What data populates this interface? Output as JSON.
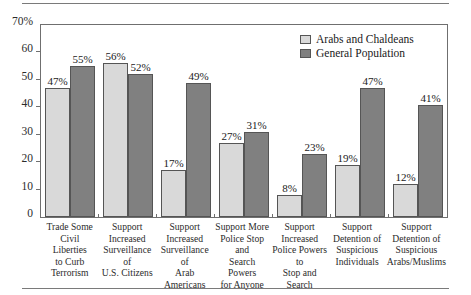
{
  "chart_data": {
    "type": "bar",
    "title": "",
    "subtitle": "",
    "xlabel": "",
    "ylabel": "",
    "ylim": [
      0,
      70
    ],
    "yticks": [
      0,
      10,
      20,
      30,
      40,
      50,
      60,
      70
    ],
    "ytick_labels": [
      "0",
      "10",
      "20",
      "30",
      "40",
      "50",
      "60",
      "70%"
    ],
    "grid": false,
    "legend_position": "top-right",
    "categories": [
      "Trade Some Civil Liberties to Curb Terrorism",
      "Support Increased Surveillance of U.S. Citizens",
      "Support Increased Surveillance of Arab Americans",
      "Support More Police Stop and Search Powers for Anyone",
      "Support Increased Police Powers to Stop and Search",
      "Support Detention of Suspicious Individuals",
      "Support Detention of Suspicious Arabs/Muslims"
    ],
    "category_lines": [
      [
        "Trade Some",
        "Civil Liberties",
        "to Curb",
        "Terrorism"
      ],
      [
        "Support",
        "Increased",
        "Surveillance of",
        "U.S. Citizens"
      ],
      [
        "Support",
        "Increased",
        "Surveillance of",
        "Arab Americans"
      ],
      [
        "Support More",
        "Police Stop and",
        "Search Powers",
        "for Anyone"
      ],
      [
        "Support",
        "Increased",
        "Police Powers to",
        "Stop and Search"
      ],
      [
        "Support",
        "Detention of",
        "Suspicious",
        "Individuals"
      ],
      [
        "Support",
        "Detention of",
        "Suspicious",
        "Arabs/Muslims"
      ]
    ],
    "series": [
      {
        "name": "Arabs and Chaldeans",
        "color": "#d9d9d9",
        "values": [
          47,
          56,
          17,
          27,
          8,
          19,
          12
        ],
        "labels": [
          "47%",
          "56%",
          "17%",
          "27%",
          "8%",
          "19%",
          "12%"
        ]
      },
      {
        "name": "General Population",
        "color": "#808080",
        "values": [
          55,
          52,
          49,
          31,
          23,
          47,
          41
        ],
        "labels": [
          "55%",
          "52%",
          "49%",
          "31%",
          "23%",
          "47%",
          "41%"
        ]
      }
    ]
  },
  "legend": {
    "entries": [
      {
        "label": "Arabs and Chaldeans",
        "swatch": "light"
      },
      {
        "label": "General Population",
        "swatch": "dark"
      }
    ]
  }
}
